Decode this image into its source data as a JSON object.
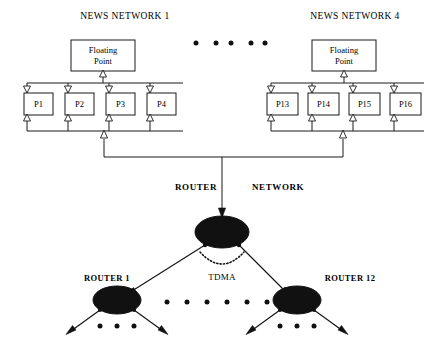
{
  "figure": {
    "type": "network-architecture-diagram",
    "background_color": "#ffffff",
    "line_color": "#111111"
  },
  "networks": [
    {
      "title": "NEWS NETWORK  1",
      "title_x": 125,
      "title_y": 19,
      "floating_point": {
        "line1": "Floating",
        "line2": "Point"
      },
      "processors": [
        {
          "label": "P1"
        },
        {
          "label": "P2"
        },
        {
          "label": "P3"
        },
        {
          "label": "P4"
        }
      ]
    },
    {
      "title": "NEWS NETWORK 4",
      "title_x": 355,
      "title_y": 19,
      "floating_point": {
        "line1": "Floating",
        "line2": "Point"
      },
      "processors": [
        {
          "label": "P13"
        },
        {
          "label": "P14"
        },
        {
          "label": "P15"
        },
        {
          "label": "P16"
        }
      ]
    }
  ],
  "ellipsis_between_networks": {
    "count": 5,
    "y": 43,
    "xs": [
      196,
      216,
      231,
      251,
      265
    ]
  },
  "router_network": {
    "label_left": "ROUTER",
    "label_right": "NETWORK",
    "label_left_x": 196,
    "label_right_x": 252,
    "label_y": 187,
    "center_node": {
      "cx": 222,
      "cy": 232,
      "rx": 27,
      "ry": 16
    },
    "tdma_label": "TDMA",
    "tdma_label_x": 222,
    "tdma_label_y": 277,
    "routers": [
      {
        "label": "ROUTER 1",
        "label_x": 107,
        "label_y": 279,
        "cx": 117,
        "cy": 300,
        "rx": 24,
        "ry": 14
      },
      {
        "label": "ROUTER 12",
        "label_x": 350,
        "label_y": 279,
        "cx": 297,
        "cy": 300,
        "rx": 24,
        "ry": 14
      }
    ],
    "mid_dots": {
      "count": 6,
      "y": 302,
      "xs": [
        167,
        187,
        207,
        227,
        247,
        267
      ]
    },
    "leaf_dots": [
      {
        "y": 326,
        "xs": [
          100,
          117,
          134
        ]
      },
      {
        "y": 326,
        "xs": [
          280,
          297,
          314
        ]
      }
    ]
  }
}
